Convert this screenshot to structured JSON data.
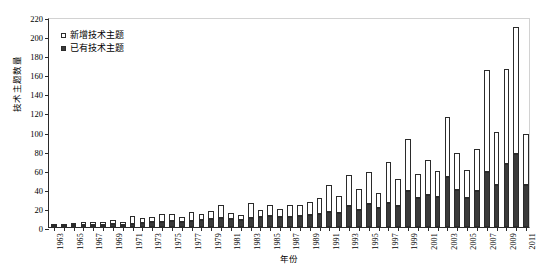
{
  "chart_data": {
    "type": "bar",
    "stacked": true,
    "title": "",
    "xlabel": "年份",
    "ylabel": "技术主题数量",
    "ylim": [
      0,
      220
    ],
    "ytick_step": 20,
    "yticks": [
      0,
      20,
      40,
      60,
      80,
      100,
      120,
      140,
      160,
      180,
      200,
      220
    ],
    "grid": false,
    "legend_position": "top-left-inside",
    "categories": [
      "1963",
      "1964",
      "1965",
      "1966",
      "1967",
      "1968",
      "1969",
      "1970",
      "1971",
      "1972",
      "1973",
      "1974",
      "1975",
      "1976",
      "1977",
      "1978",
      "1979",
      "1980",
      "1981",
      "1982",
      "1983",
      "1984",
      "1985",
      "1986",
      "1987",
      "1988",
      "1989",
      "1990",
      "1991",
      "1992",
      "1993",
      "1994",
      "1995",
      "1996",
      "1997",
      "1998",
      "1999",
      "2000",
      "2001",
      "2002",
      "2003",
      "2004",
      "2005",
      "2006",
      "2007",
      "2008",
      "2009",
      "2010",
      "2011"
    ],
    "xtick_labels": [
      "1963",
      "1965",
      "1967",
      "1969",
      "1971",
      "1973",
      "1975",
      "1977",
      "1979",
      "1981",
      "1983",
      "1985",
      "1987",
      "1989",
      "1991",
      "1993",
      "1995",
      "1997",
      "1999",
      "2001",
      "2003",
      "2005",
      "2007",
      "2009",
      "2011"
    ],
    "series": [
      {
        "name": "已有技术主题",
        "color": "#3a3a3a",
        "values": [
          1,
          1,
          2,
          2,
          2,
          2,
          3,
          2,
          3,
          4,
          5,
          5,
          6,
          5,
          6,
          7,
          8,
          9,
          8,
          7,
          9,
          10,
          12,
          10,
          11,
          12,
          13,
          14,
          16,
          15,
          22,
          18,
          24,
          20,
          25,
          22,
          38,
          30,
          34,
          31,
          52,
          39,
          30,
          38,
          58,
          44,
          66,
          76,
          44
        ]
      },
      {
        "name": "新增技术主题",
        "color": "#ffffff",
        "values": [
          1,
          1,
          2,
          3,
          3,
          3,
          4,
          3,
          9,
          5,
          6,
          9,
          8,
          6,
          10,
          7,
          9,
          14,
          7,
          6,
          16,
          8,
          11,
          9,
          12,
          11,
          13,
          16,
          28,
          17,
          32,
          22,
          34,
          16,
          43,
          28,
          54,
          26,
          36,
          28,
          63,
          39,
          30,
          44,
          107,
          56,
          100,
          134,
          53
        ]
      }
    ],
    "totals": [
      2,
      2,
      4,
      5,
      5,
      5,
      7,
      5,
      12,
      9,
      11,
      14,
      14,
      11,
      16,
      14,
      17,
      23,
      15,
      13,
      25,
      18,
      23,
      19,
      23,
      23,
      26,
      30,
      44,
      32,
      54,
      40,
      58,
      36,
      68,
      50,
      92,
      56,
      70,
      59,
      115,
      78,
      60,
      82,
      165,
      100,
      166,
      210,
      97
    ]
  },
  "legend": {
    "items": [
      {
        "label": "新增技术主题",
        "marker": "open-square"
      },
      {
        "label": "已有技术主题",
        "marker": "filled-square"
      }
    ]
  }
}
